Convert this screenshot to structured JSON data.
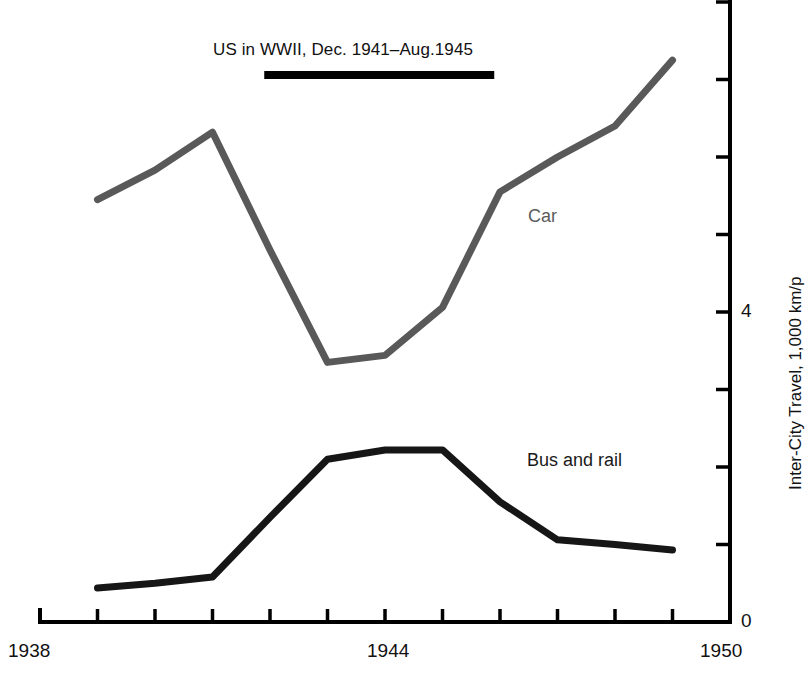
{
  "annotation": {
    "text": "US in WWII, Dec. 1941–Aug.1945",
    "bar_start_year": 1941.9,
    "bar_end_year": 1945.9
  },
  "axes": {
    "x_label_left": "1938",
    "x_label_mid": "1944",
    "x_label_right": "1950",
    "y_label_zero": "0",
    "y_label_four": "4",
    "y_title": "Inter-City Travel, 1,000 km/p"
  },
  "labels": {
    "car": "Car",
    "bus_and_rail": "Bus and rail"
  },
  "colors": {
    "car_line": "#595959",
    "bus_line": "#161616",
    "axis": "#000000",
    "annotation_bar": "#000000",
    "background": "#ffffff"
  },
  "chart_data": {
    "type": "line",
    "title": "",
    "xlabel": "",
    "ylabel": "Inter-City Travel, 1,000 km/p",
    "xlim": [
      1938,
      1950
    ],
    "ylim": [
      0,
      8
    ],
    "xticks": [
      1938,
      1939,
      1940,
      1941,
      1942,
      1943,
      1944,
      1945,
      1946,
      1947,
      1948,
      1949,
      1950
    ],
    "xticklabels": [
      "1938",
      "",
      "",
      "",
      "",
      "",
      "1944",
      "",
      "",
      "",
      "",
      "",
      "1950"
    ],
    "yticks": [
      0,
      1,
      2,
      3,
      4,
      5,
      6,
      7,
      8
    ],
    "yticklabels": [
      "0",
      "",
      "",
      "",
      "4",
      "",
      "",
      "",
      ""
    ],
    "grid": false,
    "legend": "inline-annotations",
    "x": [
      1939,
      1940,
      1941,
      1942,
      1943,
      1944,
      1945,
      1946,
      1947,
      1948,
      1949
    ],
    "series": [
      {
        "name": "Car",
        "color": "#595959",
        "values": [
          5.45,
          5.83,
          6.32,
          4.8,
          3.35,
          3.44,
          4.06,
          5.55,
          6.0,
          6.4,
          7.25
        ]
      },
      {
        "name": "Bus and rail",
        "color": "#161616",
        "values": [
          0.44,
          0.5,
          0.58,
          1.35,
          2.1,
          2.22,
          2.22,
          1.55,
          1.06,
          1.0,
          0.93
        ]
      }
    ],
    "annotations": [
      {
        "text": "US in WWII, Dec. 1941–Aug.1945",
        "type": "span-bar",
        "x_start": 1941.9,
        "x_end": 1945.9
      }
    ]
  }
}
